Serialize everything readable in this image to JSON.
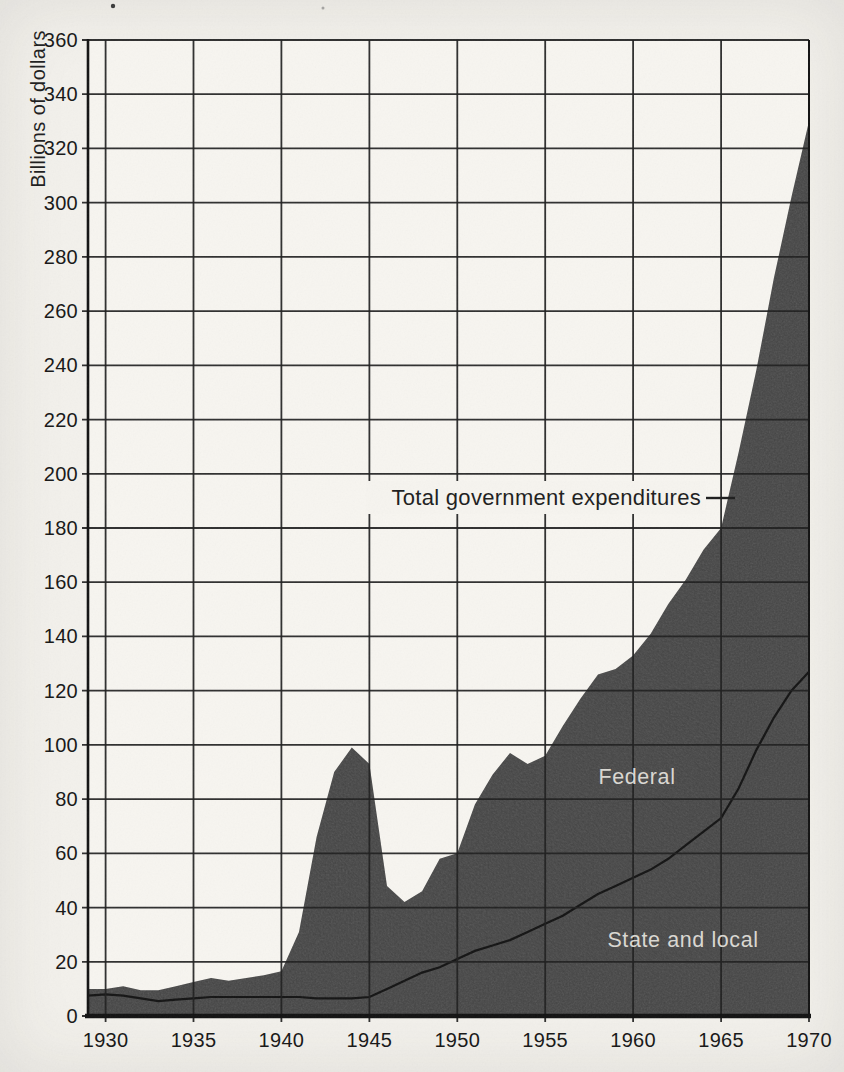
{
  "page": {
    "background": "#f3f1ec"
  },
  "chart_data": {
    "type": "area",
    "ylabel": "Billions of dollars",
    "xlim": [
      1929,
      1970
    ],
    "ylim": [
      0,
      360
    ],
    "grid": "both",
    "legend": "none",
    "xticks": [
      1930,
      1935,
      1940,
      1945,
      1950,
      1955,
      1960,
      1965,
      1970
    ],
    "yticks": [
      0,
      20,
      40,
      60,
      80,
      100,
      120,
      140,
      160,
      180,
      200,
      220,
      240,
      260,
      280,
      300,
      320,
      340,
      360
    ],
    "x": [
      1929,
      1930,
      1931,
      1932,
      1933,
      1934,
      1935,
      1936,
      1937,
      1938,
      1939,
      1940,
      1941,
      1942,
      1943,
      1944,
      1945,
      1946,
      1947,
      1948,
      1949,
      1950,
      1951,
      1952,
      1953,
      1954,
      1955,
      1956,
      1957,
      1958,
      1959,
      1960,
      1961,
      1962,
      1963,
      1964,
      1965,
      1966,
      1967,
      1968,
      1969,
      1970
    ],
    "series": [
      {
        "name": "Total government expenditures",
        "values": [
          10,
          10,
          11,
          9.5,
          9.5,
          11,
          12.5,
          14,
          13,
          14,
          15,
          16.5,
          31,
          66,
          90,
          99,
          93,
          48,
          42,
          46,
          58,
          60,
          78,
          89,
          97,
          93,
          96,
          107,
          117,
          126,
          128,
          133,
          141,
          152,
          161,
          172,
          180,
          208,
          238,
          272,
          302,
          330
        ]
      },
      {
        "name": "State and local",
        "values": [
          7.5,
          8,
          7.5,
          6.5,
          5.5,
          6,
          6.5,
          7,
          7,
          7,
          7,
          7,
          7,
          6.5,
          6.5,
          6.5,
          7,
          10,
          13,
          16,
          18,
          21,
          24,
          26,
          28,
          31,
          34,
          37,
          41,
          45,
          48,
          51,
          54,
          58,
          63,
          68,
          73,
          84,
          98,
          110,
          120,
          127
        ]
      }
    ],
    "bands": [
      {
        "name": "Federal",
        "between": [
          "Total government expenditures",
          "State and local"
        ]
      }
    ],
    "annotations": [
      {
        "text": "Total government expenditures",
        "style": "dark",
        "leader_dash": true
      },
      {
        "text": "Federal",
        "style": "light"
      },
      {
        "text": "State and local",
        "style": "light"
      }
    ],
    "colors": {
      "area_fill": "#424242",
      "grid": "#1f1f1f",
      "divider": "#141414",
      "frame": "#121212",
      "plot_bg": "#f7f5f0",
      "light_text": "#dad8d2",
      "dark_text": "#1d1d1d"
    }
  }
}
